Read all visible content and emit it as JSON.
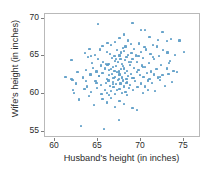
{
  "chart_data": {
    "type": "scatter",
    "title": "",
    "xlabel": "Husband's height (in inches)",
    "ylabel": "Wife's height (in inches)",
    "xlim": [
      58.8,
      77.0
    ],
    "ylim": [
      54.2,
      70.6
    ],
    "xticks": [
      60,
      65,
      70,
      75
    ],
    "yticks": [
      55,
      60,
      65,
      70
    ],
    "xtick_labels": [
      "60",
      "65",
      "70",
      "75"
    ],
    "ytick_labels": [
      "55",
      "60",
      "65",
      "70"
    ],
    "grid": false,
    "legend": null,
    "marker_color": "#5a9bc6",
    "frame_color": "#b9b9b9",
    "background": "#ffffff",
    "series": [
      {
        "name": "couples",
        "x": [
          61.2,
          61.9,
          61.9,
          62.0,
          62.1,
          62.2,
          62.4,
          62.6,
          62.8,
          63.0,
          63.2,
          63.4,
          63.5,
          63.6,
          63.7,
          63.8,
          63.9,
          64.0,
          64.1,
          64.2,
          64.3,
          64.4,
          64.5,
          64.6,
          64.7,
          64.8,
          64.9,
          65.0,
          65.0,
          65.1,
          65.2,
          65.3,
          65.3,
          65.4,
          65.5,
          65.5,
          65.6,
          65.7,
          65.8,
          65.8,
          65.9,
          66.0,
          66.0,
          66.0,
          66.1,
          66.1,
          66.2,
          66.2,
          66.3,
          66.3,
          66.4,
          66.4,
          66.5,
          66.5,
          66.5,
          66.6,
          66.6,
          66.7,
          66.7,
          66.8,
          66.8,
          66.9,
          66.9,
          67.0,
          67.0,
          67.0,
          67.0,
          67.1,
          67.1,
          67.2,
          67.2,
          67.2,
          67.3,
          67.3,
          67.4,
          67.4,
          67.5,
          67.5,
          67.5,
          67.5,
          67.6,
          67.6,
          67.7,
          67.7,
          67.8,
          67.8,
          67.8,
          67.9,
          67.9,
          68.0,
          68.0,
          68.0,
          68.0,
          68.1,
          68.1,
          68.2,
          68.2,
          68.3,
          68.3,
          68.4,
          68.4,
          68.5,
          68.5,
          68.5,
          68.6,
          68.6,
          68.7,
          68.7,
          68.8,
          68.8,
          68.9,
          69.0,
          69.0,
          69.0,
          69.1,
          69.2,
          69.2,
          69.3,
          69.4,
          69.5,
          69.5,
          69.5,
          69.6,
          69.7,
          69.8,
          69.9,
          70.0,
          70.0,
          70.0,
          70.1,
          70.2,
          70.2,
          70.3,
          70.4,
          70.5,
          70.5,
          70.6,
          70.7,
          70.8,
          70.9,
          71.0,
          71.0,
          71.1,
          71.2,
          71.3,
          71.4,
          71.5,
          71.5,
          71.6,
          71.8,
          72.0,
          72.0,
          72.1,
          72.2,
          72.3,
          72.5,
          72.5,
          72.6,
          72.8,
          73.0,
          73.0,
          73.1,
          73.2,
          73.4,
          73.5,
          73.6,
          73.8,
          74.0,
          74.2,
          74.5,
          75.0,
          63.6,
          64.2,
          65.1,
          65.9,
          66.3,
          66.7,
          67.1,
          67.4,
          67.9,
          68.3,
          68.8,
          69.2,
          69.7,
          70.2,
          70.8,
          71.4,
          72.2,
          66.0,
          66.5,
          67.0,
          67.5,
          68.0,
          68.4,
          69.0,
          65.5,
          64.8,
          70.5,
          71.9,
          73.3
        ],
        "y": [
          62.3,
          62.0,
          64.5,
          61.9,
          60.5,
          60.1,
          61.4,
          62.9,
          59.3,
          55.8,
          62.2,
          60.7,
          65.4,
          63.2,
          61.0,
          64.9,
          59.8,
          66.0,
          62.6,
          60.3,
          64.1,
          63.5,
          58.6,
          65.2,
          61.7,
          63.0,
          60.8,
          69.3,
          64.6,
          62.4,
          65.9,
          61.2,
          63.8,
          60.0,
          66.4,
          62.8,
          64.3,
          55.4,
          60.6,
          63.4,
          61.5,
          65.6,
          62.0,
          60.2,
          63.9,
          66.8,
          61.8,
          64.0,
          62.5,
          59.9,
          65.3,
          61.1,
          63.3,
          60.4,
          66.5,
          62.7,
          64.8,
          61.6,
          63.6,
          60.9,
          62.1,
          65.0,
          63.1,
          66.9,
          62.3,
          60.0,
          64.4,
          61.3,
          63.7,
          65.8,
          62.9,
          60.5,
          64.2,
          61.9,
          63.0,
          56.6,
          67.4,
          65.1,
          62.6,
          60.7,
          64.7,
          61.4,
          63.3,
          65.5,
          62.2,
          60.1,
          64.0,
          66.1,
          61.8,
          67.9,
          65.7,
          63.4,
          61.0,
          62.8,
          64.5,
          60.3,
          66.3,
          62.0,
          64.9,
          61.6,
          63.1,
          67.1,
          65.2,
          62.4,
          60.8,
          64.2,
          61.2,
          63.9,
          66.6,
          62.7,
          65.4,
          69.4,
          62.1,
          64.6,
          60.5,
          63.5,
          66.0,
          61.7,
          65.1,
          57.9,
          62.9,
          64.3,
          60.9,
          63.2,
          66.7,
          62.5,
          68.5,
          65.6,
          61.4,
          63.8,
          60.2,
          64.8,
          62.3,
          66.2,
          61.0,
          63.6,
          65.9,
          62.8,
          60.6,
          64.1,
          67.6,
          62.0,
          65.3,
          63.0,
          61.5,
          66.5,
          62.6,
          64.7,
          60.4,
          63.3,
          67.2,
          62.2,
          65.0,
          61.9,
          63.9,
          68.2,
          62.5,
          65.8,
          61.1,
          67.0,
          63.4,
          65.5,
          62.7,
          64.4,
          67.3,
          61.6,
          63.1,
          65.2,
          62.9,
          67.1,
          65.6,
          61.7,
          65.0,
          62.4,
          64.0,
          63.2,
          61.3,
          64.6,
          62.0,
          63.7,
          61.5,
          64.3,
          62.1,
          65.0,
          63.6,
          61.8,
          64.9,
          62.3,
          58.9,
          59.5,
          58.3,
          59.1,
          58.7,
          59.9,
          58.2,
          59.4,
          61.5,
          68.5,
          66.3,
          64.1
        ]
      }
    ]
  }
}
